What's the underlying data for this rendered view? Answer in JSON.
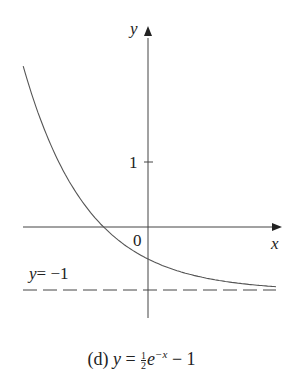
{
  "chart_data": {
    "type": "line",
    "function": "y = 0.5*exp(-x) - 1",
    "xlabel": "x",
    "ylabel": "y",
    "xlim": [
      -1.95,
      2.0
    ],
    "ylim": [
      -1.4,
      2.7
    ],
    "grid": false,
    "series": [
      {
        "name": "y = (1/2)e^(-x) - 1",
        "style": "solid",
        "x": [
          -1.95,
          -1.5,
          -1.0,
          -0.69,
          -0.5,
          0,
          0.5,
          1.0,
          1.5,
          2.0
        ],
        "y": [
          2.51,
          1.24,
          0.36,
          0.0,
          -0.18,
          -0.5,
          -0.7,
          -0.82,
          -0.89,
          -0.93
        ]
      },
      {
        "name": "y = -1",
        "style": "dashed",
        "x": [
          -1.95,
          2.0
        ],
        "y": [
          -1,
          -1
        ]
      }
    ],
    "annotations": [
      "y = −1",
      "0",
      "1"
    ]
  },
  "labels": {
    "y_axis": "y",
    "x_axis": "x",
    "origin": "0",
    "tick_1": "1",
    "asymptote_lhs": "y",
    "asymptote_rhs": "= −1"
  },
  "caption": {
    "prefix": "(d) ",
    "y": "y",
    "eq": " = ",
    "frac_num": "1",
    "frac_den": "2",
    "e": "e",
    "exp": "−x",
    "tail": " − 1"
  }
}
